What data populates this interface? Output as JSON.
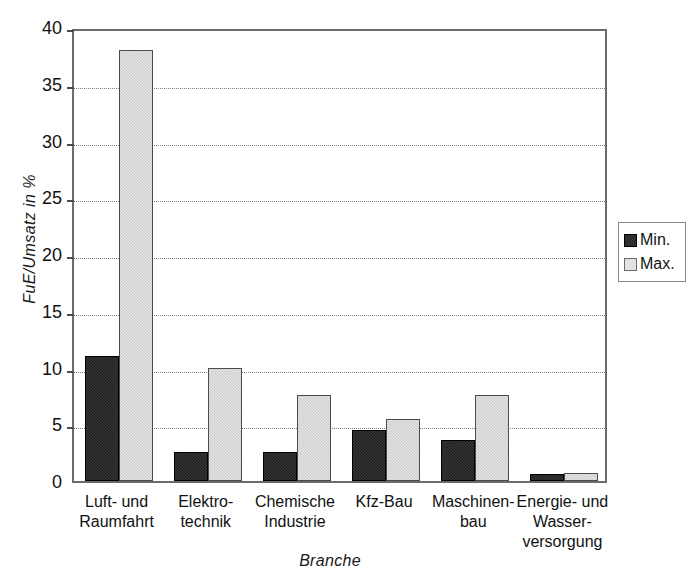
{
  "chart_data": {
    "type": "bar",
    "title": "",
    "xlabel": "Branche",
    "ylabel": "FuE/Umsatz in %",
    "ylim": [
      0,
      40
    ],
    "yticks": [
      0,
      5,
      10,
      15,
      20,
      25,
      30,
      35,
      40
    ],
    "ytick_labels": [
      "0",
      "5",
      "10",
      "15",
      "20",
      "25",
      "30",
      "35",
      "40"
    ],
    "grid": "horizontal-dotted",
    "legend_position": "right-outside",
    "categories": [
      "Luft- und\nRaumfahrt",
      "Elektro-\ntechnik",
      "Chemische\nIndustrie",
      "Kfz-Bau",
      "Maschinen-\nbau",
      "Energie- und\nWasser-\nversorgung"
    ],
    "category_lines": [
      [
        "Luft- und",
        "Raumfahrt"
      ],
      [
        "Elektro-",
        "technik"
      ],
      [
        "Chemische",
        "Industrie"
      ],
      [
        "Kfz-Bau"
      ],
      [
        "Maschinen-",
        "bau"
      ],
      [
        "Energie- und",
        "Wasser-",
        "versorgung"
      ]
    ],
    "series": [
      {
        "name": "Min.",
        "color": "#1c1c1c",
        "values": [
          11.0,
          2.6,
          2.6,
          4.5,
          3.6,
          0.6
        ]
      },
      {
        "name": "Max.",
        "color": "#c9c9c9",
        "values": [
          38.0,
          10.0,
          7.6,
          5.5,
          7.6,
          0.7
        ]
      }
    ]
  },
  "legend": {
    "entries": [
      {
        "label": "Min."
      },
      {
        "label": "Max."
      }
    ]
  }
}
